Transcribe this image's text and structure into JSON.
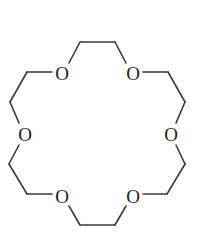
{
  "molecule": {
    "name": "18-crown-6",
    "atoms": [
      {
        "id": "O1",
        "label": "O",
        "x": 62,
        "y": 73
      },
      {
        "id": "O2",
        "label": "O",
        "x": 133,
        "y": 73
      },
      {
        "id": "O3",
        "label": "O",
        "x": 171,
        "y": 134
      },
      {
        "id": "O4",
        "label": "O",
        "x": 133,
        "y": 196
      },
      {
        "id": "O5",
        "label": "O",
        "x": 62,
        "y": 196
      },
      {
        "id": "O6",
        "label": "O",
        "x": 25,
        "y": 134
      }
    ],
    "bonds": [
      {
        "x1": 69,
        "y1": 63,
        "x2": 80,
        "y2": 42
      },
      {
        "x1": 80,
        "y1": 42,
        "x2": 115,
        "y2": 42
      },
      {
        "x1": 115,
        "y1": 42,
        "x2": 126,
        "y2": 63
      },
      {
        "x1": 143,
        "y1": 72,
        "x2": 168,
        "y2": 72
      },
      {
        "x1": 168,
        "y1": 72,
        "x2": 185,
        "y2": 102
      },
      {
        "x1": 185,
        "y1": 102,
        "x2": 176,
        "y2": 123
      },
      {
        "x1": 176,
        "y1": 145,
        "x2": 185,
        "y2": 164
      },
      {
        "x1": 185,
        "y1": 164,
        "x2": 167,
        "y2": 194
      },
      {
        "x1": 167,
        "y1": 194,
        "x2": 143,
        "y2": 194
      },
      {
        "x1": 126,
        "y1": 206,
        "x2": 115,
        "y2": 225
      },
      {
        "x1": 115,
        "y1": 225,
        "x2": 80,
        "y2": 225
      },
      {
        "x1": 80,
        "y1": 225,
        "x2": 69,
        "y2": 206
      },
      {
        "x1": 52,
        "y1": 194,
        "x2": 27,
        "y2": 194
      },
      {
        "x1": 27,
        "y1": 194,
        "x2": 9,
        "y2": 164
      },
      {
        "x1": 9,
        "y1": 164,
        "x2": 19,
        "y2": 145
      },
      {
        "x1": 19,
        "y1": 123,
        "x2": 10,
        "y2": 102
      },
      {
        "x1": 10,
        "y1": 102,
        "x2": 27,
        "y2": 72
      },
      {
        "x1": 27,
        "y1": 72,
        "x2": 52,
        "y2": 72
      }
    ],
    "colors": {
      "bond": "#3a3a3a",
      "label": "#222222",
      "background": "#ffffff"
    }
  }
}
